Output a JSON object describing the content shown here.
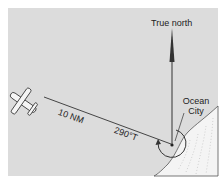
{
  "diagram": {
    "labels": {
      "north": "True north",
      "city_line1": "Ocean",
      "city_line2": "City",
      "distance": "10 NM",
      "bearing": "290°T"
    },
    "elements": {
      "aircraft": "airplane-icon",
      "north_arrow": "arrow-up-icon",
      "bearing_arc": "circular-arrow-icon",
      "station": "station-dot",
      "coastline": "coastline-shaded-land"
    },
    "colors": {
      "background": "#dcdcdc",
      "line": "#3a3a3a",
      "land": "#f2f2f2"
    }
  }
}
